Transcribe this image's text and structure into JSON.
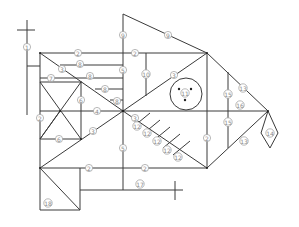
{
  "diagram": {
    "type": "labeled line drawing (fish-shaped structural frame)",
    "stroke_color": "#3a3a3a",
    "label_color": "#8a8a8a",
    "labels": [
      {
        "id": "l1",
        "text": "1",
        "x": 27,
        "y": 47
      },
      {
        "id": "l2a",
        "text": "2",
        "x": 78,
        "y": 53
      },
      {
        "id": "l2b",
        "text": "2",
        "x": 135,
        "y": 53
      },
      {
        "id": "l2c",
        "text": "2",
        "x": 40,
        "y": 118
      },
      {
        "id": "l2d",
        "text": "2",
        "x": 89,
        "y": 168
      },
      {
        "id": "l2e",
        "text": "2",
        "x": 145,
        "y": 168
      },
      {
        "id": "l2f",
        "text": "2",
        "x": 207,
        "y": 138
      },
      {
        "id": "l3a",
        "text": "3",
        "x": 62,
        "y": 69
      },
      {
        "id": "l3b",
        "text": "3",
        "x": 174,
        "y": 75
      },
      {
        "id": "l3c",
        "text": "3",
        "x": 93,
        "y": 131
      },
      {
        "id": "l3d",
        "text": "3",
        "x": 135,
        "y": 118
      },
      {
        "id": "l4",
        "text": "4",
        "x": 97,
        "y": 111
      },
      {
        "id": "l5a",
        "text": "5",
        "x": 123,
        "y": 70
      },
      {
        "id": "l5b",
        "text": "5",
        "x": 123,
        "y": 148
      },
      {
        "id": "l6a",
        "text": "6",
        "x": 81,
        "y": 100
      },
      {
        "id": "l6b",
        "text": "6",
        "x": 59,
        "y": 139
      },
      {
        "id": "l7",
        "text": "7",
        "x": 51,
        "y": 78
      },
      {
        "id": "l8a",
        "text": "8",
        "x": 80,
        "y": 64
      },
      {
        "id": "l8b",
        "text": "8",
        "x": 90,
        "y": 76
      },
      {
        "id": "l8c",
        "text": "8",
        "x": 105,
        "y": 89
      },
      {
        "id": "l8d",
        "text": "8",
        "x": 117,
        "y": 101
      },
      {
        "id": "l9a",
        "text": "9",
        "x": 123,
        "y": 35
      },
      {
        "id": "l9b",
        "text": "9",
        "x": 168,
        "y": 35
      },
      {
        "id": "l10",
        "text": "10",
        "x": 146,
        "y": 74
      },
      {
        "id": "l11",
        "text": "11",
        "x": 185,
        "y": 93
      },
      {
        "id": "l12a",
        "text": "12",
        "x": 137,
        "y": 126
      },
      {
        "id": "l12b",
        "text": "12",
        "x": 147,
        "y": 133
      },
      {
        "id": "l12c",
        "text": "12",
        "x": 157,
        "y": 141
      },
      {
        "id": "l12d",
        "text": "12",
        "x": 167,
        "y": 150
      },
      {
        "id": "l12e",
        "text": "12",
        "x": 178,
        "y": 157
      },
      {
        "id": "l13a",
        "text": "13",
        "x": 243,
        "y": 88
      },
      {
        "id": "l13b",
        "text": "13",
        "x": 244,
        "y": 141
      },
      {
        "id": "l14",
        "text": "14",
        "x": 270,
        "y": 133
      },
      {
        "id": "l15a",
        "text": "15",
        "x": 228,
        "y": 94
      },
      {
        "id": "l15b",
        "text": "15",
        "x": 228,
        "y": 122
      },
      {
        "id": "l16",
        "text": "16",
        "x": 240,
        "y": 105
      },
      {
        "id": "l17",
        "text": "17",
        "x": 140,
        "y": 184
      },
      {
        "id": "l18",
        "text": "18",
        "x": 48,
        "y": 203
      }
    ]
  }
}
